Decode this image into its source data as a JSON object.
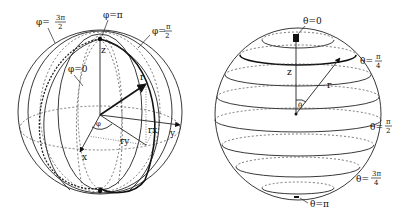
{
  "figure": {
    "left_sphere": {
      "title": "Meridians of constant phi (azimuth)",
      "labels": {
        "phi_3pi_2": "φ=3π/2",
        "phi_3pi_2_num": "3π",
        "phi_3pi_2_den": "2",
        "phi_pi": "φ=π",
        "phi_pi_2": "φ=π/2",
        "phi_pi_2_num": "π",
        "phi_pi_2_den": "2",
        "phi_0": "φ=0",
        "z_axis": "z",
        "x_axis": "x",
        "y_axis": "y",
        "r_vector": "r",
        "rx": "rx",
        "ry": "ry",
        "phi_angle": "φ"
      },
      "prefix_phi": "φ=",
      "colors": {
        "stroke": "#222222",
        "background": "#ffffff"
      }
    },
    "right_sphere": {
      "title": "Parallels of constant theta (polar angle)",
      "labels": {
        "theta_0": "θ=0",
        "theta_pi_4_num": "π",
        "theta_pi_4_den": "4",
        "theta_pi_2_num": "π",
        "theta_pi_2_den": "2",
        "theta_3pi_4_num": "3π",
        "theta_3pi_4_den": "4",
        "theta_pi": "θ=π",
        "z_axis": "z",
        "r_vector": "r",
        "theta_angle": "θ"
      },
      "prefix_theta": "θ=",
      "colors": {
        "stroke": "#222222",
        "background": "#ffffff"
      }
    }
  }
}
